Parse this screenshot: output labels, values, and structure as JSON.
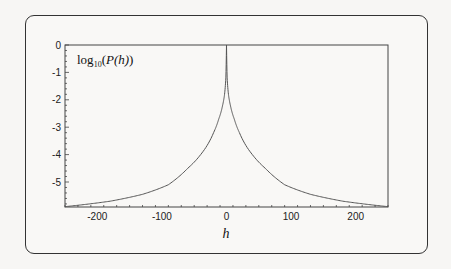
{
  "chart_data": {
    "type": "line",
    "title": "",
    "xlabel": "h",
    "ylabel": "",
    "annotation": {
      "base": "log",
      "sub": "10",
      "open": "(",
      "italic": "P(h)",
      "close": ")"
    },
    "xlim": [
      -250,
      250
    ],
    "ylim": [
      -6.0,
      0.0
    ],
    "xticks": [
      -200,
      -100,
      0,
      100,
      200
    ],
    "xtick_labels": [
      "-200",
      "-100",
      "0",
      "100",
      "200"
    ],
    "yticks": [
      0,
      -1,
      -2,
      -3,
      -4,
      -5
    ],
    "ytick_labels": [
      "0",
      "-1",
      "-2",
      "-3",
      "-4",
      "-5"
    ],
    "grid": false,
    "series": [
      {
        "name": "log10(P(h))",
        "color": "#555555",
        "symmetric": true,
        "x": [
          0,
          1,
          3,
          6,
          12,
          20,
          40,
          60,
          90,
          130,
          180,
          250
        ],
        "y": [
          0.0,
          -1.2,
          -1.8,
          -2.2,
          -2.7,
          -3.2,
          -4.0,
          -4.5,
          -5.1,
          -5.45,
          -5.7,
          -5.9
        ]
      }
    ]
  }
}
